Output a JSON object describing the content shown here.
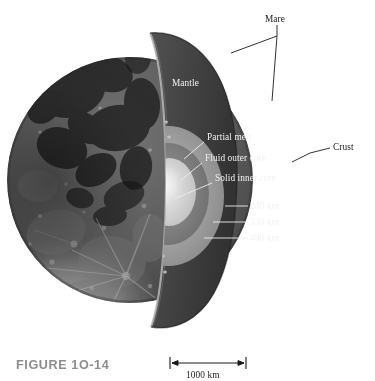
{
  "figure": {
    "caption": "FIGURE 1O-14"
  },
  "labels": {
    "mare": "Mare",
    "mantle": "Mantle",
    "crust": "Crust",
    "partial_melt": "Partial melt",
    "fluid_outer_core": "Fluid outer core",
    "solid_inner_core": "Solid inner core"
  },
  "depths": {
    "partial_melt_depth": "240 km",
    "fluid_outer_core_depth": "330 km",
    "solid_inner_core_depth": "480 km"
  },
  "scale_bar": {
    "value": "1000 km"
  },
  "colors": {
    "mantle_fill": "#3d3d3d",
    "cut_face_fill": "#474747",
    "crust_rim": "#b9b9b9",
    "partial_melt_blob": "#c9c9c9",
    "outer_shell": "#9a9a9a",
    "fluid_outer_core": "#7e7e7e",
    "solid_inner_core": "#d8d8d8",
    "core_center": "#f0f0f0",
    "caption_gray": "#8d8d8d",
    "label_dark": "#1a1a1a",
    "label_light": "#f2f2f2",
    "page_background": "#ffffff"
  }
}
